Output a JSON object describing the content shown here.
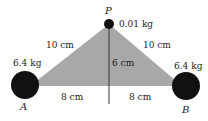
{
  "diagram": {
    "type": "physics-gravitation",
    "colors": {
      "triangle_fill": "#a8a8a8",
      "mass": "#111111",
      "line": "#333333",
      "text": "#222222"
    },
    "point_p": {
      "label": "P",
      "mass": "0.01 kg"
    },
    "mass_a": {
      "label": "A",
      "mass": "6.4 kg"
    },
    "mass_b": {
      "label": "B",
      "mass": "6.4 kg"
    },
    "distances": {
      "pa": "10 cm",
      "pb": "10 cm",
      "height": "6 cm",
      "base_left": "8 cm",
      "base_right": "8 cm"
    }
  }
}
